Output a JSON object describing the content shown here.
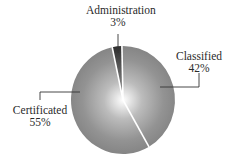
{
  "chart_data": {
    "type": "pie",
    "title": "",
    "categories": [
      "Administration",
      "Classified",
      "Certificated"
    ],
    "values": [
      3,
      42,
      55
    ],
    "unit": "%",
    "labels": [
      {
        "name": "Administration",
        "pct": "3%"
      },
      {
        "name": "Classified",
        "pct": "42%"
      },
      {
        "name": "Certificated",
        "pct": "55%"
      }
    ],
    "colors": {
      "Administration": "#3a3a3a",
      "Classified": "#8c8c8c",
      "Certificated": "#8c8c8c",
      "separator": "#ffffff",
      "center_highlight": "#ffffff"
    },
    "legend": "none (callout labels)",
    "start_angle_deg": -12,
    "direction": "clockwise"
  }
}
